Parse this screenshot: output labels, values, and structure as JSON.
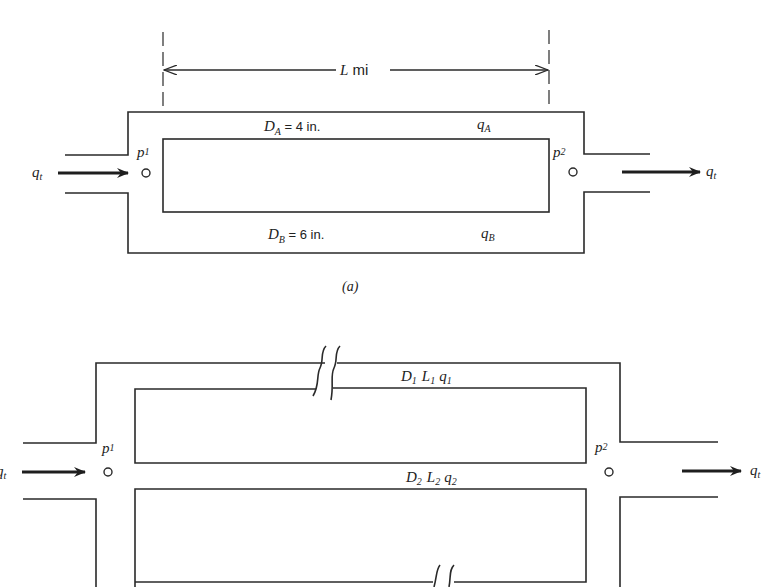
{
  "figure_a": {
    "length_label_var": "L",
    "length_label_unit": " mi",
    "pipe_a": {
      "diameter_var": "D",
      "diameter_sub": "A",
      "diameter_value": " = 4 in.",
      "flow_var": "q",
      "flow_sub": "A"
    },
    "pipe_b": {
      "diameter_var": "D",
      "diameter_sub": "B",
      "diameter_value": " = 6 in.",
      "flow_var": "q",
      "flow_sub": "B"
    },
    "inlet": {
      "pressure_var": "p",
      "pressure_sub": "1",
      "flow_var": "q",
      "flow_sub": "t"
    },
    "outlet": {
      "pressure_var": "p",
      "pressure_sub": "2",
      "flow_var": "q",
      "flow_sub": "t"
    },
    "caption": "(a)"
  },
  "figure_b": {
    "pipe_1": {
      "d": "D",
      "d_sub": "1",
      "l": "L",
      "l_sub": "1",
      "q": "q",
      "q_sub": "1"
    },
    "pipe_2": {
      "d": "D",
      "d_sub": "2",
      "l": "L",
      "l_sub": "2",
      "q": "q",
      "q_sub": "2"
    },
    "inlet": {
      "pressure_var": "p",
      "pressure_sub": "1",
      "flow_var": "q",
      "flow_sub": "t"
    },
    "outlet": {
      "pressure_var": "p",
      "pressure_sub": "2",
      "flow_var": "q",
      "flow_sub": "t"
    }
  },
  "colors": {
    "line": "#2a2a2a",
    "background": "#ffffff"
  }
}
